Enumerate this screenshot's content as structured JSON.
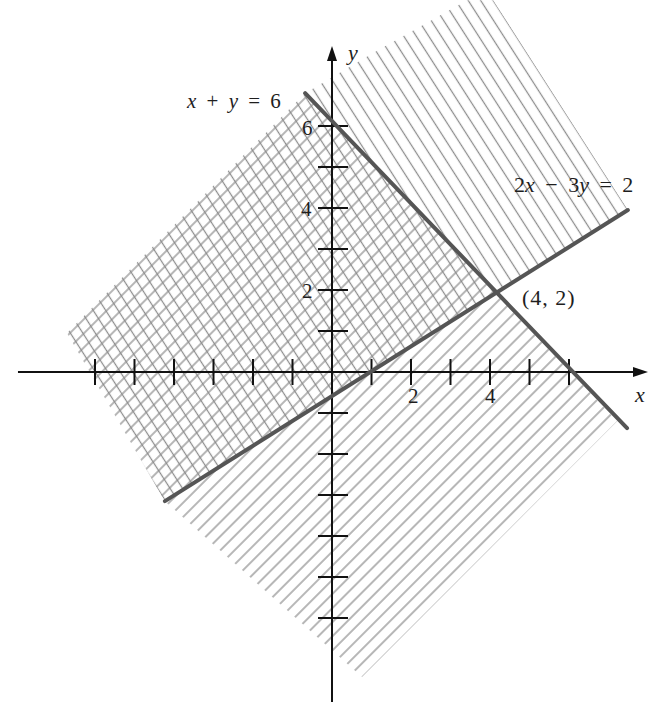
{
  "chart_data": {
    "type": "line",
    "title": "",
    "xlabel": "x",
    "ylabel": "y",
    "xlim": [
      -7.95,
      8.0
    ],
    "ylim": [
      -8.05,
      7.95
    ],
    "grid": false,
    "legend": null,
    "x_ticks": [
      -6,
      -5,
      -4,
      -3,
      -2,
      -1,
      1,
      2,
      3,
      4,
      5,
      6
    ],
    "y_ticks": [
      -6,
      -5,
      -4,
      -3,
      -2,
      -1,
      1,
      2,
      3,
      4,
      5,
      6
    ],
    "x_tick_labels": [
      {
        "value": 2,
        "label": "2"
      },
      {
        "value": 4,
        "label": "4"
      }
    ],
    "y_tick_labels": [
      {
        "value": 6,
        "label": "6"
      },
      {
        "value": 4,
        "label": "4"
      },
      {
        "value": 2,
        "label": "2"
      }
    ],
    "series": [
      {
        "name": "x + y = 6",
        "equation": "x + y = 6",
        "points": [
          [
            -0.68,
            6.8
          ],
          [
            7.47,
            -1.37
          ]
        ],
        "color": "#555555"
      },
      {
        "name": "2x − 3y = 2",
        "equation": "2x − 3y = 2",
        "points": [
          [
            -4.23,
            -3.15
          ],
          [
            7.49,
            3.95
          ]
        ],
        "color": "#555555"
      }
    ],
    "annotations": [
      {
        "text": "(4, 2)",
        "x": 4,
        "y": 2
      }
    ],
    "regions": [
      {
        "boundary": "2x − 3y = 2",
        "side": "above-left of line",
        "pattern": "single hatch, lines perpendicular to boundary",
        "polygon": [
          [
            -6.71,
            0.95
          ],
          [
            -0.68,
            6.8
          ],
          [
            1.04,
            7.78
          ],
          [
            3.42,
            9.07
          ],
          [
            4.08,
            9.07
          ],
          [
            7.49,
            3.95
          ],
          [
            -4.23,
            -3.15
          ]
        ]
      },
      {
        "boundary": "x + y = 6",
        "side": "below-left of line",
        "pattern": "single hatch, lines perpendicular to boundary",
        "polygon": [
          [
            -6.71,
            0.95
          ],
          [
            -0.68,
            6.8
          ],
          [
            7.22,
            -1.2
          ],
          [
            0.76,
            -7.44
          ],
          [
            -4.23,
            -3.15
          ]
        ]
      }
    ],
    "overlap": {
      "pattern": "cross-hatch",
      "vertices_approx": [
        [
          -6.71,
          0.95
        ],
        [
          -0.68,
          6.8
        ],
        [
          4,
          2
        ],
        [
          -4.23,
          -3.15
        ]
      ]
    },
    "colors": {
      "background": "#ffffff",
      "axis": "#111111",
      "boundary_line": "#555555",
      "hatch": "#8c8c8c"
    }
  }
}
